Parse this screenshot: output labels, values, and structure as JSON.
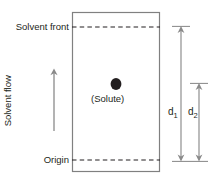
{
  "diagram": {
    "plate": {
      "name": "chromatography-plate",
      "border_color": "#808080",
      "fill_color": "#ffffff",
      "x": 72,
      "y": 12,
      "width": 88,
      "height": 160
    },
    "labels": {
      "solvent_front": "Solvent front",
      "origin": "Origin",
      "solvent_flow": "Solvent flow",
      "solute": "(Solute)",
      "d1": "d",
      "d1_sub": "1",
      "d2": "d",
      "d2_sub": "2"
    },
    "lines": {
      "solvent_front_line": {
        "name": "solvent-front-dashed-line",
        "style": "dashed",
        "color": "#231f20",
        "y": 27,
        "x1": 72,
        "x2": 160
      },
      "origin_line": {
        "name": "origin-dashed-line",
        "style": "dashed",
        "color": "#231f20",
        "y": 160,
        "x1": 72,
        "x2": 160
      }
    },
    "solute_spot": {
      "name": "solute-spot",
      "color": "#231f20",
      "cx": 116,
      "cy": 84,
      "rx": 5.5,
      "ry": 6
    },
    "flow_arrow": {
      "name": "solvent-flow-arrow",
      "color": "#808080",
      "direction": "up",
      "x": 54,
      "y_top": 69,
      "y_bottom": 131
    },
    "dimensions": [
      {
        "name": "d1-dimension-arrow",
        "label": "d1",
        "color": "#808080",
        "x": 181,
        "y_top": 27,
        "y_bottom": 160,
        "meaning": "distance from origin to solvent front"
      },
      {
        "name": "d2-dimension-arrow",
        "label": "d2",
        "color": "#808080",
        "x": 199,
        "y_top": 84,
        "y_bottom": 160,
        "meaning": "distance from origin to solute spot"
      }
    ]
  }
}
